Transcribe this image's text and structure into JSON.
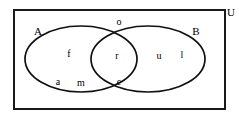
{
  "figure": {
    "type": "venn-diagram",
    "sets": 2,
    "width": 239,
    "height": 118,
    "background_color": "#ffffff",
    "stroke_color": "#111111"
  },
  "universe": {
    "label": "U",
    "label_x": 231,
    "label_y": 13,
    "rect": {
      "x": 14,
      "y": 10,
      "width": 211,
      "height": 99
    }
  },
  "sets": [
    {
      "name": "A",
      "label": "A",
      "label_x": 38,
      "label_y": 32,
      "ellipse": {
        "cx": 81,
        "cy": 59,
        "rx": 56,
        "ry": 33
      }
    },
    {
      "name": "B",
      "label": "B",
      "label_x": 196,
      "label_y": 32,
      "ellipse": {
        "cx": 148,
        "cy": 59,
        "rx": 57,
        "ry": 33
      }
    }
  ],
  "elements": [
    {
      "text": "f",
      "region": "A-only",
      "x": 69,
      "y": 55
    },
    {
      "text": "a",
      "region": "A-only",
      "x": 58,
      "y": 83
    },
    {
      "text": "m",
      "region": "A-only",
      "x": 81,
      "y": 84
    },
    {
      "text": "o",
      "region": "outside-top-crossing",
      "x": 119,
      "y": 23
    },
    {
      "text": "r",
      "region": "A-intersect-B",
      "x": 117,
      "y": 57
    },
    {
      "text": "e",
      "region": "A-intersect-B",
      "x": 119,
      "y": 83
    },
    {
      "text": "u",
      "region": "B-only",
      "x": 159,
      "y": 57
    },
    {
      "text": "l",
      "region": "B-only",
      "x": 182,
      "y": 56
    }
  ]
}
